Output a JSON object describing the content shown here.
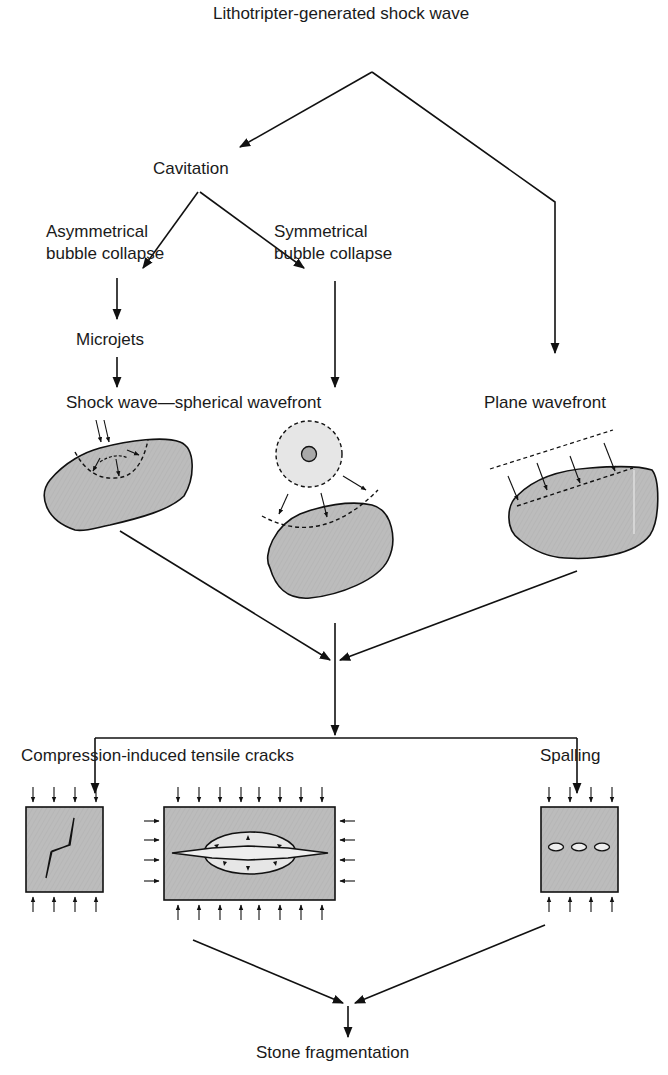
{
  "diagram": {
    "title": "Lithotripter-generated shock wave",
    "nodes": {
      "source": "Lithotripter-generated shock wave",
      "cavitation": "Cavitation",
      "asym_line1": "Asymmetrical",
      "asym_line2": "bubble collapse",
      "sym_line1": "Symmetrical",
      "sym_line2": "bubble collapse",
      "microjets": "Microjets",
      "spherical": "Shock wave—spherical wavefront",
      "plane": "Plane wavefront",
      "tensile": "Compression-induced tensile cracks",
      "spalling": "Spalling",
      "result": "Stone fragmentation"
    },
    "edges": [
      [
        "Lithotripter-generated shock wave",
        "Cavitation"
      ],
      [
        "Lithotripter-generated shock wave",
        "Plane wavefront"
      ],
      [
        "Cavitation",
        "Asymmetrical bubble collapse"
      ],
      [
        "Cavitation",
        "Symmetrical bubble collapse"
      ],
      [
        "Asymmetrical bubble collapse",
        "Microjets"
      ],
      [
        "Microjets",
        "Shock wave—spherical wavefront"
      ],
      [
        "Symmetrical bubble collapse",
        "Shock wave—spherical wavefront"
      ],
      [
        "Stone illustrations",
        "Merge point"
      ],
      [
        "Merge point",
        "Compression-induced tensile cracks"
      ],
      [
        "Merge point",
        "Spalling"
      ],
      [
        "Compression-induced tensile cracks",
        "Stone fragmentation"
      ],
      [
        "Spalling",
        "Stone fragmentation"
      ]
    ],
    "colors": {
      "line": "#111111",
      "stone_fill": "#bdbdbd",
      "bubble_fill": "#e6e6e6",
      "core_fill": "#a9a9a9",
      "background": "#ffffff"
    }
  }
}
